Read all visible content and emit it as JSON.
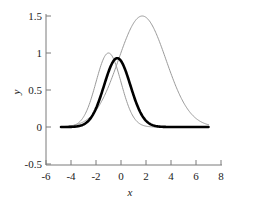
{
  "chart_data": {
    "type": "line",
    "title": "",
    "subtitle": "",
    "xlabel": "x",
    "ylabel": "y",
    "xlim": [
      -6,
      8
    ],
    "ylim": [
      -0.5,
      1.5
    ],
    "xticks": [
      -6,
      -4,
      -2,
      0,
      2,
      4,
      6,
      8
    ],
    "xtick_labels": [
      "-6",
      "-4",
      "-2",
      "0",
      "2",
      "4",
      "6",
      "8"
    ],
    "yticks": [
      -0.5,
      0,
      0.5,
      1,
      1.5
    ],
    "ytick_labels": [
      "-0.5",
      "0",
      "0.5",
      "1",
      "1.5"
    ],
    "grid": false,
    "legend": "none",
    "x_domain_drawn": [
      -4.8,
      7.0
    ],
    "series": [
      {
        "name": "narrow-gray-gaussian",
        "color": "#9a9a9a",
        "linewidth": 1,
        "peak_x": -1.0,
        "peak_y": 1.0,
        "sigma": 1.0,
        "amplitude": 1.0,
        "x": [
          -4.8,
          -4.4,
          -4.0,
          -3.6,
          -3.2,
          -2.8,
          -2.4,
          -2.0,
          -1.6,
          -1.2,
          -0.8,
          -0.4,
          0.0,
          0.4,
          0.8,
          1.2,
          1.6,
          2.0,
          2.4,
          2.8,
          3.2,
          3.6,
          4.0,
          4.4,
          4.8,
          5.2,
          5.6,
          6.0,
          6.4,
          7.0
        ],
        "y": [
          0.003,
          0.007,
          0.011,
          0.02,
          0.034,
          0.055,
          0.086,
          0.135,
          0.198,
          0.277,
          0.368,
          0.487,
          0.607,
          0.72,
          0.835,
          0.92,
          0.98,
          1.0,
          0.98,
          0.92,
          0.835,
          0.72,
          0.607,
          0.487,
          0.368,
          0.277,
          0.198,
          0.135,
          0.086,
          0.044
        ]
      },
      {
        "name": "wide-tall-gray-gaussian",
        "color": "#9a9a9a",
        "linewidth": 1,
        "peak_x": 1.7,
        "peak_y": 1.5,
        "sigma": 1.9,
        "amplitude": 1.5,
        "x": [
          -4.8,
          -4.4,
          -4.0,
          -3.6,
          -3.2,
          -2.8,
          -2.4,
          -2.0,
          -1.6,
          -1.2,
          -0.8,
          -0.4,
          0.0,
          0.4,
          0.8,
          1.2,
          1.6,
          2.0,
          2.4,
          2.8,
          3.2,
          3.6,
          4.0,
          4.4,
          4.8,
          5.2,
          5.6,
          6.0,
          6.4,
          7.0
        ],
        "y": [
          0.031,
          0.046,
          0.067,
          0.095,
          0.132,
          0.18,
          0.24,
          0.313,
          0.398,
          0.494,
          0.6,
          0.71,
          0.82,
          0.99,
          1.14,
          1.29,
          1.44,
          1.5,
          1.47,
          1.4,
          1.28,
          1.13,
          0.97,
          0.8,
          0.64,
          0.5,
          0.37,
          0.27,
          0.19,
          0.1
        ]
      },
      {
        "name": "thick-black-gaussian",
        "color": "#000000",
        "linewidth": 2.6,
        "peak_x": -0.3,
        "peak_y": 0.93,
        "sigma": 1.05,
        "amplitude": 0.93,
        "x": [
          -4.8,
          -4.4,
          -4.0,
          -3.6,
          -3.2,
          -2.8,
          -2.4,
          -2.0,
          -1.6,
          -1.2,
          -0.8,
          -0.4,
          0.0,
          0.4,
          0.8,
          1.2,
          1.6,
          2.0,
          2.4,
          2.8,
          3.2,
          3.6,
          4.0,
          4.4,
          4.8,
          5.2,
          5.6,
          6.0,
          6.4,
          7.0
        ],
        "y": [
          0.002,
          0.004,
          0.008,
          0.013,
          0.022,
          0.038,
          0.062,
          0.1,
          0.16,
          0.25,
          0.42,
          0.65,
          0.9,
          0.93,
          0.78,
          0.56,
          0.35,
          0.2,
          0.11,
          0.055,
          0.03,
          0.018,
          0.011,
          0.008,
          0.005,
          0.004,
          0.003,
          0.002,
          0.002,
          0.001
        ]
      }
    ]
  },
  "axes": {
    "x_axis_name": "x-axis",
    "y_axis_name": "y-axis"
  }
}
